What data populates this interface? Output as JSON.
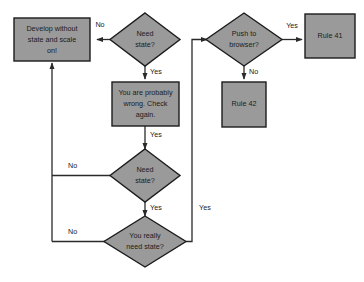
{
  "diagram": {
    "colors": {
      "node_fill": "#9a9a9a",
      "node_stroke": "#1c1c1c",
      "edge_stroke": "#2a2a2a",
      "text": "#1a1a1a",
      "background": "#ffffff"
    },
    "nodes": [
      {
        "id": "develop-without-state",
        "shape": "rectangle",
        "lines": [
          "Develop without",
          "state and scale",
          "on!"
        ]
      },
      {
        "id": "need-state-1",
        "shape": "diamond",
        "lines": [
          "Need",
          "state?"
        ]
      },
      {
        "id": "push-to-browser",
        "shape": "diamond",
        "lines": [
          "Push to",
          "browser?"
        ]
      },
      {
        "id": "rule-41",
        "shape": "rectangle",
        "lines": [
          "Rule 41"
        ]
      },
      {
        "id": "rule-42",
        "shape": "rectangle",
        "lines": [
          "Rule 42"
        ]
      },
      {
        "id": "probably-wrong",
        "shape": "rectangle",
        "lines": [
          "You are probably",
          "wrong. Check",
          "again."
        ]
      },
      {
        "id": "need-state-2",
        "shape": "diamond",
        "lines": [
          "Need",
          "state?"
        ]
      },
      {
        "id": "really-need-state",
        "shape": "diamond",
        "lines": [
          "You really",
          "need state?"
        ]
      }
    ],
    "edges": [
      {
        "id": "need-state-1-no",
        "from": "need-state-1",
        "to": "develop-without-state",
        "label": "No"
      },
      {
        "id": "need-state-1-yes",
        "from": "need-state-1",
        "to": "probably-wrong",
        "label": "Yes"
      },
      {
        "id": "probably-wrong-yes",
        "from": "probably-wrong",
        "to": "need-state-2",
        "label": "Yes"
      },
      {
        "id": "need-state-2-no",
        "from": "need-state-2",
        "to": "develop-without-state",
        "label": "No"
      },
      {
        "id": "need-state-2-yes",
        "from": "need-state-2",
        "to": "really-need-state",
        "label": "Yes"
      },
      {
        "id": "really-need-state-no",
        "from": "really-need-state",
        "to": "develop-without-state",
        "label": "No"
      },
      {
        "id": "really-need-state-yes",
        "from": "really-need-state",
        "to": "push-to-browser",
        "label": "Yes"
      },
      {
        "id": "push-to-browser-yes",
        "from": "push-to-browser",
        "to": "rule-41",
        "label": "Yes"
      },
      {
        "id": "push-to-browser-no",
        "from": "push-to-browser",
        "to": "rule-42",
        "label": "No"
      }
    ]
  }
}
